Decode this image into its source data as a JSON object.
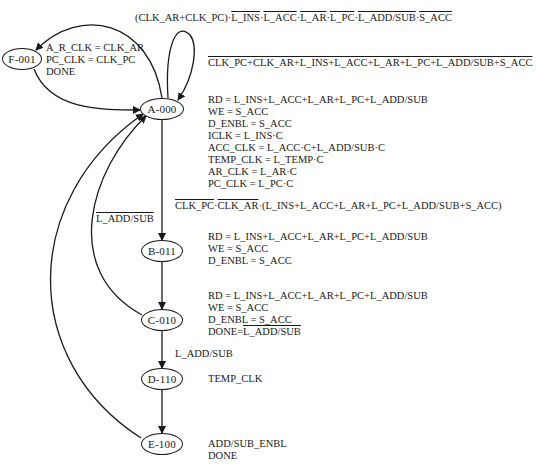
{
  "diagram": {
    "type": "state-machine",
    "nodes": [
      {
        "id": "F-001",
        "label": "F-001",
        "outputs": [
          "A_R_CLK = CLK_AR",
          "PC_CLK = CLK_PC",
          "DONE"
        ]
      },
      {
        "id": "A-000",
        "label": "A-000",
        "outputs": [
          "RD = L_INS+L_ACC+L_AR+L_PC+L_ADD/SUB",
          "WE = S_ACC",
          "D_ENBL = S_ACC",
          "ICLK = L_INS·C",
          "ACC_CLK = L_ACC·C+L_ADD/SUB·C",
          "TEMP_CLK = L_TEMP·C",
          "AR_CLK = L_AR·C",
          "PC_CLK = L_PC·C"
        ]
      },
      {
        "id": "B-011",
        "label": "B-011",
        "outputs": [
          "RD = L_INS+L_ACC+L_AR+L_PC+L_ADD/SUB",
          "WE = S_ACC",
          "D_ENBL = S_ACC"
        ]
      },
      {
        "id": "C-010",
        "label": "C-010",
        "outputs": [
          "RD = L_INS+L_ACC+L_AR+L_PC+L_ADD/SUB",
          "WE = S_ACC",
          "D_ENBL = S_ACC"
        ],
        "done_prefix": "DONE=",
        "done_overlined": "L_ADD/SUB"
      },
      {
        "id": "D-110",
        "label": "D-110",
        "outputs": [
          "TEMP_CLK"
        ]
      },
      {
        "id": "E-100",
        "label": "E-100",
        "outputs": [
          "ADD/SUB_ENBL",
          "DONE"
        ]
      }
    ],
    "transitions": {
      "a_to_f": {
        "prefix": "(CLK_AR+CLK_PC)·",
        "terms": [
          "L_INS",
          "L_ACC",
          "L_AR",
          "L_PC",
          "L_ADD/SUB",
          "S_ACC"
        ],
        "all_overlined": true,
        "separator": "·"
      },
      "a_self": {
        "label": "CLK_PC+CLK_AR+L_INS+L_ACC+L_AR+L_PC+L_ADD/SUB+S_ACC",
        "overlined": true
      },
      "a_to_b": {
        "term1": "CLK_PC",
        "term2": "CLK_AR",
        "rest": "·(L_INS+L_ACC+L_AR+L_PC+L_ADD/SUB+S_ACC)",
        "overlined_terms": [
          "CLK_PC",
          "CLK_AR"
        ]
      },
      "c_to_a": {
        "label": "L_ADD/SUB",
        "overlined": true
      },
      "c_to_d": {
        "label": "L_ADD/SUB",
        "overlined": false
      },
      "f_to_a": {
        "label": ""
      },
      "b_to_c": {
        "label": ""
      },
      "d_to_e": {
        "label": ""
      },
      "e_to_a": {
        "label": ""
      }
    }
  }
}
